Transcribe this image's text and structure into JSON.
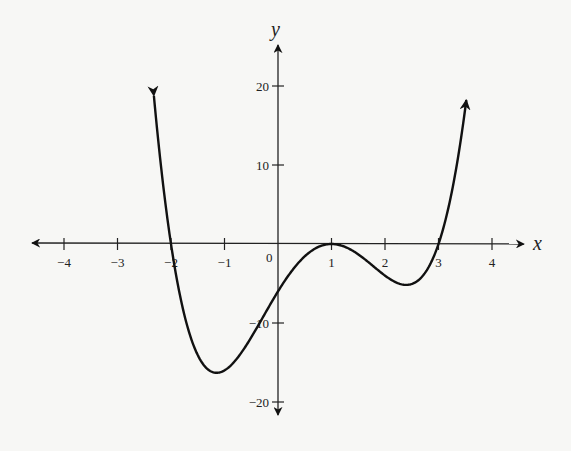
{
  "chart_data": {
    "type": "line",
    "title": "",
    "xlabel": "x",
    "ylabel": "y",
    "function": "y = (x+2)(x-1)^2(x-3)",
    "xlim": [
      -4.5,
      4.5
    ],
    "ylim": [
      -22,
      24
    ],
    "x_ticks": [
      -4,
      -3,
      -2,
      -1,
      1,
      2,
      3,
      4
    ],
    "x_tick_labels": [
      "-4",
      "-3",
      "-2",
      "-1",
      "1",
      "2",
      "3",
      "4"
    ],
    "y_ticks": [
      20,
      10,
      -10,
      -20
    ],
    "y_tick_labels": [
      "20",
      "10",
      "-10",
      "-20"
    ],
    "origin_label": "0",
    "grid": false,
    "legend": null,
    "key_points": [
      {
        "x": -2,
        "y": 0,
        "note": "x-intercept"
      },
      {
        "x": -1.2,
        "y": -16.3,
        "note": "local minimum"
      },
      {
        "x": 0,
        "y": -6,
        "note": "y-intercept"
      },
      {
        "x": 1,
        "y": 0,
        "note": "local maximum / double root"
      },
      {
        "x": 2.4,
        "y": -5.2,
        "note": "local minimum"
      },
      {
        "x": 3,
        "y": 0,
        "note": "x-intercept"
      }
    ],
    "x": [
      -2.32,
      -2.2,
      -2.0,
      -1.8,
      -1.6,
      -1.4,
      -1.2,
      -1.0,
      -0.8,
      -0.6,
      -0.4,
      -0.2,
      0.0,
      0.2,
      0.4,
      0.6,
      0.8,
      1.0,
      1.2,
      1.4,
      1.6,
      1.8,
      2.0,
      2.2,
      2.4,
      2.6,
      2.8,
      3.0,
      3.2,
      3.4,
      3.52
    ],
    "series": [
      {
        "name": "f(x)",
        "values": [
          18.6,
          10.8,
          0,
          -7.1,
          -11.7,
          -14.6,
          -16.3,
          -16.0,
          -14.6,
          -12.3,
          -9.5,
          -6.5,
          -6.0,
          -3.6,
          -1.7,
          -0.6,
          -0.1,
          0,
          -0.1,
          -0.6,
          -1.4,
          -2.4,
          -4.0,
          -4.9,
          -5.2,
          -4.2,
          -2.4,
          0,
          4.4,
          9.5,
          18.6
        ]
      }
    ],
    "curve_arrows": "both ends point upward",
    "axes_arrows": "both axes have arrowheads at both ends"
  }
}
